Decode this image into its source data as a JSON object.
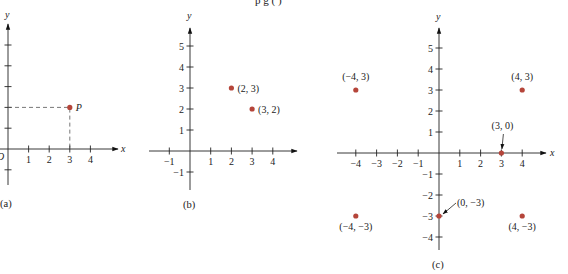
{
  "header_fragment": "p          g     ( )",
  "point_color": "#b5453a",
  "panels": [
    {
      "id": "a",
      "caption": "(a)",
      "x_axis_label": "x",
      "y_axis_label": "y",
      "origin_label": "O",
      "x_ticks": [
        1,
        2,
        3,
        4
      ],
      "x_tick_labels": [
        "1",
        "2",
        "3",
        "4"
      ],
      "y_ticks": [
        -1,
        1,
        2,
        3,
        4,
        5
      ],
      "points": [
        {
          "x": 3,
          "y": 2,
          "label": "P",
          "dashed_projection": true
        }
      ]
    },
    {
      "id": "b",
      "caption": "(b)",
      "y_axis_label": "y",
      "x_ticks": [
        -1,
        1,
        2,
        3,
        4
      ],
      "x_tick_labels": [
        "−1",
        "1",
        "2",
        "3",
        "4"
      ],
      "y_ticks": [
        -1,
        1,
        2,
        3,
        4,
        5
      ],
      "y_tick_labels": [
        "−1",
        "1",
        "2",
        "3",
        "4",
        "5"
      ],
      "points": [
        {
          "x": 2,
          "y": 3,
          "label": "(2, 3)"
        },
        {
          "x": 3,
          "y": 2,
          "label": "(3, 2)"
        }
      ]
    },
    {
      "id": "c",
      "caption": "(c)",
      "x_axis_label": "x",
      "y_axis_label": "y",
      "x_ticks": [
        -4,
        -3,
        -2,
        -1,
        1,
        2,
        3,
        4
      ],
      "x_tick_labels": [
        "−4",
        "−3",
        "−2",
        "−1",
        "1",
        "2",
        "3",
        "4"
      ],
      "y_ticks": [
        -4,
        -3,
        -2,
        -1,
        1,
        2,
        3,
        4,
        5
      ],
      "y_tick_labels": [
        "−4",
        "−3",
        "−2",
        "−1",
        "1",
        "2",
        "3",
        "4",
        "5"
      ],
      "points": [
        {
          "x": -4,
          "y": 3,
          "label": "(−4, 3)"
        },
        {
          "x": 4,
          "y": 3,
          "label": "(4, 3)"
        },
        {
          "x": 3,
          "y": 0,
          "label": "(3, 0)"
        },
        {
          "x": 0,
          "y": -3,
          "label": "(0, −3)"
        },
        {
          "x": -4,
          "y": -3,
          "label": "(−4, −3)"
        },
        {
          "x": 4,
          "y": -3,
          "label": "(4, −3)"
        }
      ]
    }
  ]
}
